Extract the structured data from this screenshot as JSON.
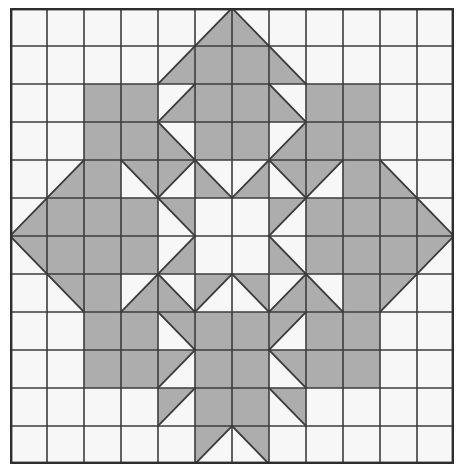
{
  "figure": {
    "name": "quilt-block-pattern",
    "kind": "geometric-grid-pattern",
    "width_px": 465,
    "height_px": 473
  },
  "grid": {
    "columns": 12,
    "rows": 12,
    "origin_x_px": 10,
    "origin_y_px": 8,
    "cell_width_px": 37,
    "cell_height_px": 38,
    "show_gridlines": true,
    "outer_border": true
  },
  "colors": {
    "background": "#ffffff",
    "empty_cell_fill": "#f7f7f7",
    "shaded_cell_fill": "#adadad",
    "gridline": "#3c3c3c",
    "shape_outline": "#3c3c3c",
    "outer_border": "#2e2e2e"
  },
  "strokes": {
    "gridline_width_px": 1.6,
    "outer_border_width_px": 2.4,
    "diagonal_width_px": 1.8
  },
  "legend": {
    "cell_codes": {
      "e": "empty square",
      "f": "fully shaded square",
      "tl": "shaded triangle in top-left half",
      "tr": "shaded triangle in top-right half",
      "bl": "shaded triangle in bottom-left half",
      "br": "shaded triangle in bottom-right half"
    }
  },
  "chart_data": {
    "type": "heatmap",
    "title": "",
    "xlabel": "",
    "ylabel": "",
    "categories_x": [
      "0",
      "1",
      "2",
      "3",
      "4",
      "5",
      "6",
      "7",
      "8",
      "9",
      "10",
      "11"
    ],
    "categories_y": [
      "0",
      "1",
      "2",
      "3",
      "4",
      "5",
      "6",
      "7",
      "8",
      "9",
      "10",
      "11"
    ],
    "cells": [
      [
        "e",
        "e",
        "e",
        "e",
        "e",
        "br",
        "bl",
        "e",
        "e",
        "e",
        "e",
        "e"
      ],
      [
        "e",
        "e",
        "e",
        "e",
        "br",
        "f",
        "f",
        "bl",
        "e",
        "e",
        "e",
        "e"
      ],
      [
        "e",
        "e",
        "f",
        "f",
        "br",
        "f",
        "f",
        "bl",
        "f",
        "f",
        "e",
        "e"
      ],
      [
        "e",
        "e",
        "f",
        "f",
        "bl",
        "f",
        "f",
        "br",
        "f",
        "f",
        "e",
        "e"
      ],
      [
        "e",
        "br",
        "f",
        "tr",
        "tl",
        "bl",
        "br",
        "tr",
        "tl",
        "f",
        "bl",
        "e"
      ],
      [
        "br",
        "f",
        "f",
        "f",
        "tr",
        "e",
        "e",
        "tl",
        "f",
        "f",
        "f",
        "bl"
      ],
      [
        "tr",
        "f",
        "f",
        "f",
        "br",
        "e",
        "e",
        "bl",
        "f",
        "f",
        "f",
        "tl"
      ],
      [
        "e",
        "tr",
        "f",
        "br",
        "bl",
        "tl",
        "tr",
        "br",
        "bl",
        "f",
        "tl",
        "e"
      ],
      [
        "e",
        "e",
        "f",
        "f",
        "tr",
        "f",
        "f",
        "tl",
        "f",
        "f",
        "e",
        "e"
      ],
      [
        "e",
        "e",
        "f",
        "f",
        "tl",
        "f",
        "f",
        "tr",
        "f",
        "f",
        "e",
        "e"
      ],
      [
        "e",
        "e",
        "e",
        "e",
        "tl",
        "f",
        "f",
        "tr",
        "e",
        "e",
        "e",
        "e"
      ],
      [
        "e",
        "e",
        "e",
        "e",
        "e",
        "tl",
        "tr",
        "e",
        "e",
        "e",
        "e",
        "e"
      ]
    ]
  }
}
